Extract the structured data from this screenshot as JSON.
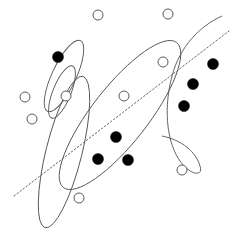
{
  "figure": {
    "width": 233,
    "height": 241,
    "background_color": "#ffffff"
  },
  "style": {
    "contour_stroke": "#555555",
    "contour_stroke_width": 0.9,
    "boundary_stroke": "#666666",
    "boundary_dash": "1.6 2.2",
    "hollow_fill": "#ffffff",
    "hollow_stroke": "#5a5a5a",
    "filled_fill": "#000000"
  },
  "chart_data": {
    "type": "scatter",
    "title": "",
    "xlabel": "",
    "ylabel": "",
    "xlim": [
      0,
      233
    ],
    "ylim": [
      0,
      241
    ],
    "grid": false,
    "legend": "none",
    "axes_visible": false,
    "note": "Coordinates are in pixel space with origin at top-left of the 233x241 canvas.",
    "series": [
      {
        "name": "Class A (hollow circles)",
        "marker": "open-circle",
        "marker_radius": 5,
        "fill": "#ffffff",
        "stroke": "#5a5a5a",
        "count": 9,
        "points": [
          {
            "id": "a1",
            "x": 98,
            "y": 15
          },
          {
            "id": "a2",
            "x": 168,
            "y": 14
          },
          {
            "id": "a3",
            "x": 163,
            "y": 62
          },
          {
            "id": "a4",
            "x": 25,
            "y": 97
          },
          {
            "id": "a5",
            "x": 66,
            "y": 96
          },
          {
            "id": "a6",
            "x": 124,
            "y": 96
          },
          {
            "id": "a7",
            "x": 32,
            "y": 119
          },
          {
            "id": "a8",
            "x": 182,
            "y": 170
          },
          {
            "id": "a9",
            "x": 79,
            "y": 198
          }
        ]
      },
      {
        "name": "Class B (filled circles)",
        "marker": "filled-circle",
        "marker_radius": 5.5,
        "fill": "#000000",
        "stroke": "#000000",
        "count": 7,
        "points": [
          {
            "id": "b1",
            "x": 58,
            "y": 57
          },
          {
            "id": "b2",
            "x": 213,
            "y": 64
          },
          {
            "id": "b3",
            "x": 193,
            "y": 84
          },
          {
            "id": "b4",
            "x": 184,
            "y": 106
          },
          {
            "id": "b5",
            "x": 116,
            "y": 137
          },
          {
            "id": "b6",
            "x": 98,
            "y": 159
          },
          {
            "id": "b7",
            "x": 128,
            "y": 160
          }
        ]
      }
    ],
    "contours": [
      {
        "id": "contour-top-left-small",
        "label": "narrow ellipse enclosing upper-left filled point",
        "type": "ellipse",
        "cx": 64,
        "cy": 76,
        "rx": 12,
        "ry": 39,
        "rotation_deg": 25,
        "encloses": [
          "b1",
          "a5"
        ]
      },
      {
        "id": "contour-inner-tiny",
        "label": "small ellipse around mid-left hollow point",
        "type": "ellipse",
        "cx": 62,
        "cy": 92,
        "rx": 9,
        "ry": 28,
        "rotation_deg": 22,
        "encloses": [
          "a5"
        ]
      },
      {
        "id": "contour-long-left",
        "label": "long narrow ellipse spanning lower-left",
        "type": "ellipse",
        "cx": 64,
        "cy": 152,
        "rx": 18,
        "ry": 78,
        "rotation_deg": 14,
        "encloses": [
          "a9"
        ]
      },
      {
        "id": "contour-diagonal-large",
        "label": "large tilted ellipse from upper-left to lower-right center",
        "type": "ellipse",
        "cx": 120,
        "cy": 115,
        "rx": 28,
        "ry": 92,
        "rotation_deg": 38,
        "encloses": [
          "b5",
          "b6",
          "b7",
          "a6"
        ]
      },
      {
        "id": "contour-right-crescent",
        "label": "large right-side crescent contour around filled cluster",
        "type": "open-curve",
        "encloses": [
          "b2",
          "b3",
          "b4",
          "a8"
        ]
      }
    ],
    "decision_boundary": {
      "id": "dotted-diagonal",
      "label": "dotted linear decision boundary",
      "style": "dotted",
      "x1": 14,
      "y1": 196,
      "x2": 229,
      "y2": 31,
      "slope_description": "rises from lower-left to upper-right"
    }
  }
}
